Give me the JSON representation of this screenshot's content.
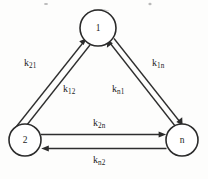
{
  "figure": {
    "type": "three-node-rate-constant-diagram",
    "background_color": "#fdfdfc",
    "ink_color": "#2b2b2b",
    "nodes": [
      {
        "id": "1",
        "label": "1",
        "cx": 98,
        "cy": 28,
        "r": 18
      },
      {
        "id": "2",
        "label": "2",
        "cx": 25,
        "cy": 140,
        "r": 16
      },
      {
        "id": "n",
        "label": "n",
        "cx": 182,
        "cy": 140,
        "r": 16
      }
    ],
    "edges": [
      {
        "id": "k21",
        "from": "2",
        "to": "1",
        "label_k": "k",
        "label_sub": "21"
      },
      {
        "id": "k12",
        "from": "1",
        "to": "2",
        "label_k": "k",
        "label_sub": "12"
      },
      {
        "id": "k1n",
        "from": "1",
        "to": "n",
        "label_k": "k",
        "label_sub": "1n"
      },
      {
        "id": "kn1",
        "from": "n",
        "to": "1",
        "label_k": "k",
        "label_sub": "n1"
      },
      {
        "id": "k2n",
        "from": "2",
        "to": "n",
        "label_k": "k",
        "label_sub": "2n"
      },
      {
        "id": "kn2",
        "from": "n",
        "to": "2",
        "label_k": "k",
        "label_sub": "n2"
      }
    ]
  }
}
